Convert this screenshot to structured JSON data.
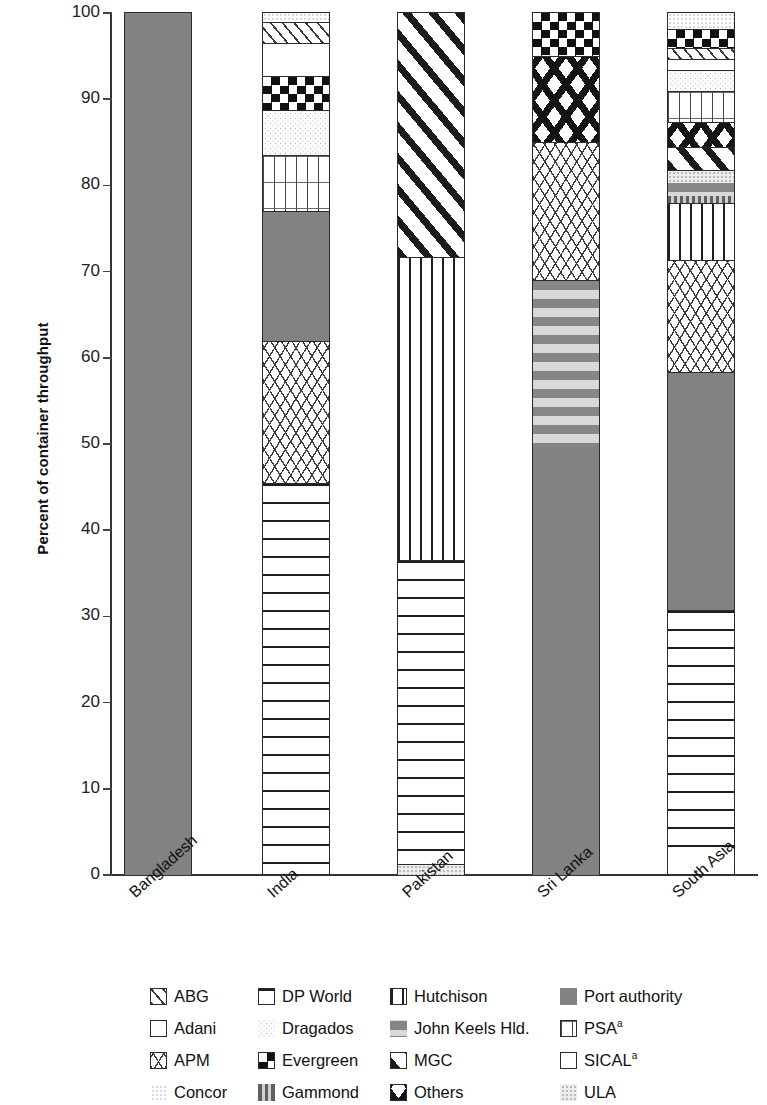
{
  "chart_data": {
    "type": "bar",
    "title": "",
    "xlabel": "",
    "ylabel": "Percent of container throughput",
    "ylim": [
      0,
      100
    ],
    "yticks": [
      0,
      10,
      20,
      30,
      40,
      50,
      60,
      70,
      80,
      90,
      100
    ],
    "stacked": true,
    "grid": false,
    "legend_position": "bottom",
    "categories": [
      "Bangladesh",
      "India",
      "Pakistan",
      "Sri Lanka",
      "South Asia"
    ],
    "series": [
      {
        "name": "ABG",
        "pattern": "diagonal-lines-light",
        "values": [
          0,
          3.5,
          0,
          0,
          1.2
        ]
      },
      {
        "name": "Adani",
        "pattern": "empty-white",
        "values": [
          0,
          3.8,
          0,
          0,
          1.3
        ]
      },
      {
        "name": "APM",
        "pattern": "crosshatch-light",
        "values": [
          0,
          16.5,
          0,
          16.0,
          12.9
        ]
      },
      {
        "name": "Concor",
        "pattern": "light-dots",
        "values": [
          0,
          1.0,
          0,
          0,
          0.7
        ]
      },
      {
        "name": "DP World",
        "pattern": "horizontal-lines",
        "values": [
          0,
          44.2,
          35.2,
          0,
          29.3
        ]
      },
      {
        "name": "Dragados",
        "pattern": "speckle-light",
        "values": [
          0,
          5.2,
          0,
          0,
          2.5
        ]
      },
      {
        "name": "Evergreen",
        "pattern": "checkerboard",
        "values": [
          0,
          4.0,
          0,
          5.0,
          2.3
        ]
      },
      {
        "name": "Gammond",
        "pattern": "vertical-gray-bars",
        "values": [
          0,
          0,
          0,
          0,
          0.8
        ]
      },
      {
        "name": "Hutchison",
        "pattern": "vertical-lines",
        "values": [
          0,
          0,
          35.2,
          0,
          6.7
        ]
      },
      {
        "name": "John Keels Hld.",
        "pattern": "gray-stripes",
        "values": [
          0,
          0,
          0,
          19.3,
          1.5
        ]
      },
      {
        "name": "MGC",
        "pattern": "diagonal-lines-bold",
        "values": [
          0,
          0,
          28.3,
          0,
          2.6
        ]
      },
      {
        "name": "Others",
        "pattern": "bold-diamond-x",
        "values": [
          0,
          0,
          0,
          10.0,
          2.9
        ]
      },
      {
        "name": "Port authority",
        "pattern": "solid-gray",
        "values": [
          100,
          15.0,
          0,
          49.7,
          27.1
        ]
      },
      {
        "name": "PSA",
        "pattern": "grid",
        "values": [
          0,
          6.5,
          0,
          0,
          3.6
        ]
      },
      {
        "name": "SICAL",
        "pattern": "empty-white",
        "values": [
          0,
          0,
          0,
          0,
          1.3
        ]
      },
      {
        "name": "ULA",
        "pattern": "light-gray-speckle",
        "values": [
          0,
          0,
          1.3,
          0,
          3.3
        ]
      }
    ],
    "bars": [
      {
        "category": "Bangladesh",
        "segments": [
          {
            "label": "Port authority",
            "from": 0,
            "to": 100
          }
        ]
      },
      {
        "category": "India",
        "segments": [
          {
            "label": "DP World",
            "from": 1.3,
            "to": 45.5
          },
          {
            "label": "APM",
            "from": 45.5,
            "to": 62.0
          },
          {
            "label": "Port authority",
            "from": 62.0,
            "to": 77.0
          },
          {
            "label": "PSA",
            "from": 77.0,
            "to": 83.5
          },
          {
            "label": "Dragados",
            "from": 83.5,
            "to": 88.7
          },
          {
            "label": "Evergreen",
            "from": 88.7,
            "to": 92.7
          },
          {
            "label": "Adani",
            "from": 92.7,
            "to": 96.5
          },
          {
            "label": "ABG",
            "from": 96.5,
            "to": 99.0
          },
          {
            "label": "Concor",
            "from": 99.0,
            "to": 100
          }
        ]
      },
      {
        "category": "Pakistan",
        "segments": [
          {
            "label": "ULA",
            "from": 0,
            "to": 1.3
          },
          {
            "label": "DP World",
            "from": 1.3,
            "to": 36.5
          },
          {
            "label": "Hutchison",
            "from": 36.5,
            "to": 71.7
          },
          {
            "label": "MGC",
            "from": 71.7,
            "to": 100
          }
        ]
      },
      {
        "category": "Sri Lanka",
        "segments": [
          {
            "label": "Port authority",
            "from": 0,
            "to": 49.7
          },
          {
            "label": "John Keels Hld.",
            "from": 49.7,
            "to": 69.0
          },
          {
            "label": "APM",
            "from": 69.0,
            "to": 85.0
          },
          {
            "label": "Others",
            "from": 85.0,
            "to": 95.0
          },
          {
            "label": "Evergreen",
            "from": 95.0,
            "to": 100
          }
        ]
      },
      {
        "category": "South Asia",
        "segments": [
          {
            "label": "DP World",
            "from": 1.4,
            "to": 30.7
          },
          {
            "label": "Port authority",
            "from": 30.7,
            "to": 58.4
          },
          {
            "label": "APM",
            "from": 58.4,
            "to": 71.3
          },
          {
            "label": "Hutchison",
            "from": 71.3,
            "to": 78.0
          },
          {
            "label": "Gammond",
            "from": 78.0,
            "to": 78.8
          },
          {
            "label": "John Keels Hld.",
            "from": 78.8,
            "to": 80.3
          },
          {
            "label": "ULA",
            "from": 80.3,
            "to": 81.8
          },
          {
            "label": "MGC",
            "from": 81.8,
            "to": 84.4
          },
          {
            "label": "Others",
            "from": 84.4,
            "to": 87.3
          },
          {
            "label": "PSA",
            "from": 87.3,
            "to": 90.9
          },
          {
            "label": "Dragados",
            "from": 90.9,
            "to": 93.4
          },
          {
            "label": "SICAL",
            "from": 93.4,
            "to": 94.7
          },
          {
            "label": "ABG",
            "from": 94.7,
            "to": 95.9
          },
          {
            "label": "Evergreen",
            "from": 95.9,
            "to": 98.2
          },
          {
            "label": "Concor",
            "from": 98.2,
            "to": 100
          }
        ]
      }
    ]
  },
  "axis": {
    "y_title": "Percent of container throughput",
    "y_labels": [
      "100",
      "90",
      "80",
      "70",
      "60",
      "50",
      "40",
      "30",
      "20",
      "10",
      "0"
    ]
  },
  "legend": {
    "rows": [
      [
        {
          "label": "ABG",
          "icon": "swatch-diagonal-lines-light"
        },
        {
          "label": "DP World",
          "icon": "swatch-horizontal-lines"
        },
        {
          "label": "Hutchison",
          "icon": "swatch-vertical-lines"
        },
        {
          "label": "Port authority",
          "icon": "swatch-solid-gray"
        }
      ],
      [
        {
          "label": "Adani",
          "icon": "swatch-empty-white"
        },
        {
          "label": "Dragados",
          "icon": "swatch-speckle-light"
        },
        {
          "label": "John Keels Hld.",
          "icon": "swatch-gray-stripes"
        },
        {
          "label": "PSA",
          "icon": "swatch-grid",
          "sup": "a"
        }
      ],
      [
        {
          "label": "APM",
          "icon": "swatch-crosshatch-light"
        },
        {
          "label": "Evergreen",
          "icon": "swatch-checkerboard"
        },
        {
          "label": "MGC",
          "icon": "swatch-diagonal-lines-bold"
        },
        {
          "label": "SICAL",
          "icon": "swatch-empty-white",
          "sup": "a"
        }
      ],
      [
        {
          "label": "Concor",
          "icon": "swatch-light-dots"
        },
        {
          "label": "Gammond",
          "icon": "swatch-vertical-gray-bars"
        },
        {
          "label": "Others",
          "icon": "swatch-bold-diamond-x"
        },
        {
          "label": "ULA",
          "icon": "swatch-light-gray-speckle"
        }
      ]
    ]
  },
  "colors": {
    "port_authority": "#828282",
    "line": "#2b2b2b",
    "text": "#111111",
    "background": "#ffffff"
  }
}
